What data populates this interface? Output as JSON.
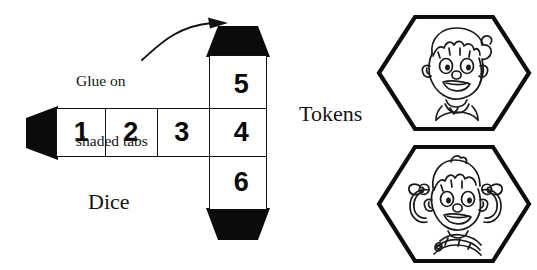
{
  "page": {
    "background_color": "#ffffff",
    "ink_color": "#111111",
    "width": 537,
    "height": 270
  },
  "dice": {
    "label": "Dice",
    "faces": [
      {
        "id": "cell-1",
        "value": "1"
      },
      {
        "id": "cell-2",
        "value": "2"
      },
      {
        "id": "cell-3",
        "value": "3"
      },
      {
        "id": "cell-4",
        "value": "4"
      },
      {
        "id": "cell-5",
        "value": "5"
      },
      {
        "id": "cell-6",
        "value": "6"
      }
    ],
    "tabs": [
      {
        "id": "tab-top",
        "name": "glue-tab-top",
        "fill": "#000000"
      },
      {
        "id": "tab-bottom",
        "name": "glue-tab-bottom",
        "fill": "#000000"
      },
      {
        "id": "tab-left",
        "name": "glue-tab-left",
        "fill": "#000000"
      }
    ]
  },
  "annotation": {
    "glue_line_1": "Glue on",
    "glue_line_2": "shaded tabs",
    "arrow": "curved-arrow-icon"
  },
  "tokens": {
    "label": "Tokens",
    "items": [
      {
        "id": "token-boy",
        "icon": "boy-face-icon",
        "shape": "hexagon"
      },
      {
        "id": "token-girl",
        "icon": "girl-face-icon",
        "shape": "hexagon"
      }
    ]
  }
}
